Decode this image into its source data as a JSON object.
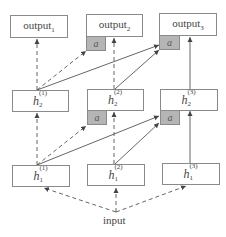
{
  "diagram": {
    "outputs": [
      {
        "id": "output1",
        "base": "output",
        "index": "1",
        "has_attention": false
      },
      {
        "id": "output2",
        "base": "output",
        "index": "2",
        "has_attention": true
      },
      {
        "id": "output3",
        "base": "output",
        "index": "3",
        "has_attention": true
      }
    ],
    "layer2": [
      {
        "id": "h2_1",
        "base": "h",
        "layer": "2",
        "col": "(1)",
        "has_attention": false
      },
      {
        "id": "h2_2",
        "base": "h",
        "layer": "2",
        "col": "(2)",
        "has_attention": true
      },
      {
        "id": "h2_3",
        "base": "h",
        "layer": "2",
        "col": "(3)",
        "has_attention": true
      }
    ],
    "layer1": [
      {
        "id": "h1_1",
        "base": "h",
        "layer": "1",
        "col": "(1)"
      },
      {
        "id": "h1_2",
        "base": "h",
        "layer": "1",
        "col": "(2)"
      },
      {
        "id": "h1_3",
        "base": "h",
        "layer": "1",
        "col": "(3)"
      }
    ],
    "attention_label": "a",
    "input_label": "input",
    "edges": [
      {
        "from": "h2_1",
        "to": "output1",
        "style": "dashed"
      },
      {
        "from": "h2_1",
        "to": "output2.a",
        "style": "dashed"
      },
      {
        "from": "h2_1",
        "to": "output3.a",
        "style": "solid"
      },
      {
        "from": "h2_2",
        "to": "output2",
        "style": "dashed"
      },
      {
        "from": "h2_2",
        "to": "output3.a",
        "style": "solid"
      },
      {
        "from": "h2_3",
        "to": "output3",
        "style": "solid"
      },
      {
        "from": "h1_1",
        "to": "h2_1",
        "style": "dashed"
      },
      {
        "from": "h1_1",
        "to": "h2_2.a",
        "style": "dashed"
      },
      {
        "from": "h1_1",
        "to": "h2_3.a",
        "style": "solid"
      },
      {
        "from": "h1_2",
        "to": "h2_2",
        "style": "dashed"
      },
      {
        "from": "h1_2",
        "to": "h2_3.a",
        "style": "solid"
      },
      {
        "from": "h1_3",
        "to": "h2_3",
        "style": "solid"
      },
      {
        "from": "input",
        "to": "h1_1",
        "style": "dashed"
      },
      {
        "from": "input",
        "to": "h1_2",
        "style": "dashed"
      },
      {
        "from": "input",
        "to": "h1_3",
        "style": "dashed"
      }
    ],
    "colors": {
      "border": "#8a8a8a",
      "attention_fill": "#b5b5b5",
      "line": "#555555"
    }
  }
}
